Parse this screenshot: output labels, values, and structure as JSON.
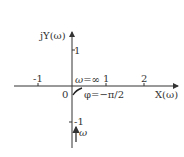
{
  "diagram": {
    "type": "nyquist-plot",
    "axes": {
      "y_label": "jY(ω)",
      "x_label": "X(ω)",
      "origin_label": "0"
    },
    "x_ticks": [
      "-1",
      "1",
      "2"
    ],
    "y_ticks": [
      "1",
      "-1"
    ],
    "annotations": {
      "omega_inf": "ω=∞",
      "phase": "φ=−π/2",
      "omega_dir": "ω"
    },
    "colors": {
      "line": "#333333",
      "background": "#ffffff"
    }
  }
}
